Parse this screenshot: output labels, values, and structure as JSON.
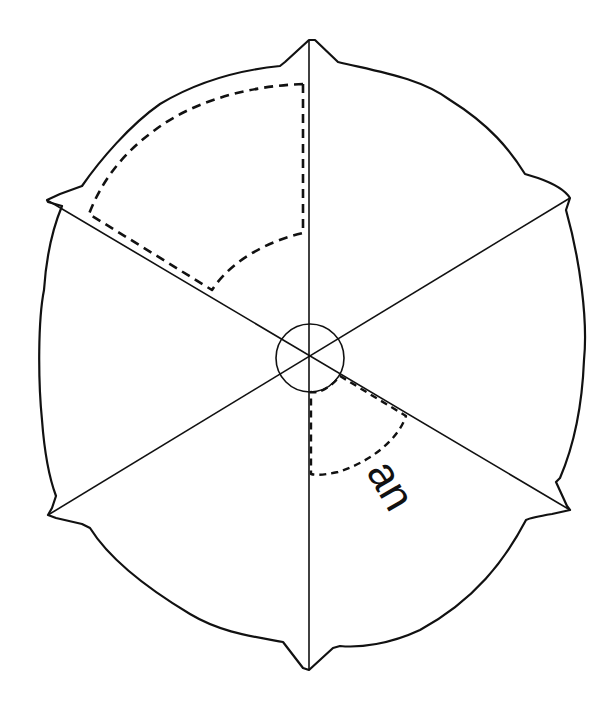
{
  "diagram": {
    "type": "hexagonal-umbrella-canopy",
    "center": [
      309,
      358
    ],
    "hub_radius": 34,
    "vertices": {
      "top": [
        309,
        40
      ],
      "upper_right": [
        570,
        198
      ],
      "lower_right": [
        570,
        510
      ],
      "bottom": [
        309,
        670
      ],
      "lower_left": [
        48,
        515
      ],
      "upper_left": [
        47,
        200
      ]
    },
    "annotation": {
      "label": "an",
      "rotation_deg": 60
    },
    "colors": {
      "stroke": "#111111",
      "background": "#ffffff"
    }
  }
}
